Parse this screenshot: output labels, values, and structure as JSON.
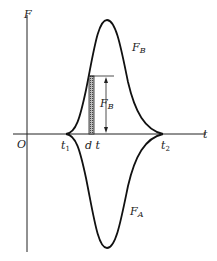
{
  "diagram": {
    "axis_y_label": "F",
    "axis_x_label": "t",
    "origin_label": "O",
    "t1_label": "t",
    "t1_sub": "1",
    "t2_label": "t",
    "t2_sub": "2",
    "dt_label": "d t",
    "curve_upper_label": "F",
    "curve_upper_sub": "B",
    "curve_lower_label": "F",
    "curve_lower_sub": "A",
    "strip_height_label": "F",
    "strip_height_sub": "B"
  }
}
